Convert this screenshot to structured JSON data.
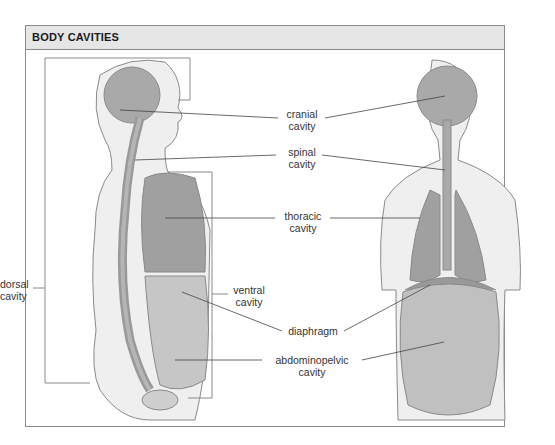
{
  "header": {
    "title": "BODY CAVITIES"
  },
  "labels": {
    "cranial": {
      "line1": "cranial",
      "line2": "cavity"
    },
    "spinal": {
      "line1": "spinal",
      "line2": "cavity"
    },
    "thoracic": {
      "line1": "thoracic",
      "line2": "cavity"
    },
    "ventral": {
      "line1": "ventral",
      "line2": "cavity"
    },
    "dorsal": {
      "line1": "dorsal",
      "line2": "cavity"
    },
    "diaphragm": {
      "line1": "diaphragm"
    },
    "abdominopelvic": {
      "line1": "abdominopelvic",
      "line2": "cavity"
    }
  },
  "colors": {
    "cavity": "#a9a9a9",
    "body": "#ededed",
    "outline": "#8a8a8a",
    "header_bg": "#e6e6e6"
  }
}
